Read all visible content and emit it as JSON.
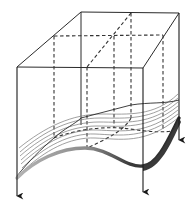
{
  "diagram": {
    "type": "3d-box-with-layered-surface",
    "colors": {
      "edge": "#2a2a2a",
      "dashed": "#333333",
      "contour": "#666666",
      "front_edge_light": "#a8a8a8",
      "front_edge_dark": "#3a3a3a"
    },
    "box": {
      "front_top_left": [
        17,
        67
      ],
      "front_top_right": [
        143,
        68
      ],
      "back_top_left": [
        81,
        12
      ],
      "back_top_right": [
        179,
        13
      ],
      "mid_top_left": [
        54,
        36
      ],
      "mid_top_right": [
        163,
        35
      ],
      "divider_top_front": [
        87,
        67
      ],
      "divider_top_back": [
        131,
        13
      ]
    },
    "arrows": [
      {
        "name": "front-left-arrow",
        "x": 17,
        "y1": 67,
        "y2": 192
      },
      {
        "name": "front-right-arrow",
        "x": 143,
        "y1": 68,
        "y2": 188
      },
      {
        "name": "back-right-arrow",
        "x": 179,
        "y1": 13,
        "y2": 137
      }
    ],
    "surface_layers": 9
  }
}
